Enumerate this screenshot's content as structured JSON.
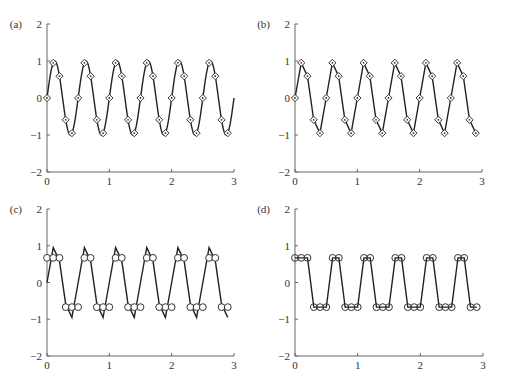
{
  "figure": {
    "layout": "2x2 grid",
    "colors": {
      "line": "#222222",
      "axis": "#666666",
      "marker_fill": "#ffffff",
      "background": "#ffffff"
    }
  },
  "chart_data": [
    {
      "panel": "(a)",
      "type": "line",
      "description": "Continuous sinusoid (2 Hz) with samples taken every 0.1 s shown as diamonds",
      "xlim": [
        0,
        3
      ],
      "ylim": [
        -2,
        2
      ],
      "xticks": [
        "0",
        "1",
        "2",
        "3"
      ],
      "yticks": [
        "-2",
        "-1",
        "0",
        "1",
        "2"
      ],
      "grid": false,
      "series": [
        {
          "name": "continuous signal",
          "style": "smooth line",
          "function": "sin(2*pi*2*t)",
          "t_range": [
            0,
            3
          ]
        },
        {
          "name": "samples",
          "style": "diamond markers",
          "x": [
            0,
            0.1,
            0.2,
            0.3,
            0.4,
            0.5,
            0.6,
            0.7,
            0.8,
            0.9,
            1.0,
            1.1,
            1.2,
            1.3,
            1.4,
            1.5,
            1.6,
            1.7,
            1.8,
            1.9,
            2.0,
            2.1,
            2.2,
            2.3,
            2.4,
            2.5,
            2.6,
            2.7,
            2.8,
            2.9
          ],
          "values": [
            0,
            0.95,
            0.59,
            -0.59,
            -0.95,
            0,
            0.95,
            0.59,
            -0.59,
            -0.95,
            0,
            0.95,
            0.59,
            -0.59,
            -0.95,
            0,
            0.95,
            0.59,
            -0.59,
            -0.95,
            0,
            0.95,
            0.59,
            -0.59,
            -0.95,
            0,
            0.95,
            0.59,
            -0.59,
            -0.95
          ]
        }
      ]
    },
    {
      "panel": "(b)",
      "type": "line",
      "description": "Samples (diamonds) connected by straight line segments",
      "xlim": [
        0,
        3
      ],
      "ylim": [
        -2,
        2
      ],
      "xticks": [
        "0",
        "1",
        "2",
        "3"
      ],
      "yticks": [
        "-2",
        "-1",
        "0",
        "1",
        "2"
      ],
      "grid": false,
      "series": [
        {
          "name": "sampled signal",
          "style": "line with diamond markers",
          "x": [
            0,
            0.1,
            0.2,
            0.3,
            0.4,
            0.5,
            0.6,
            0.7,
            0.8,
            0.9,
            1.0,
            1.1,
            1.2,
            1.3,
            1.4,
            1.5,
            1.6,
            1.7,
            1.8,
            1.9,
            2.0,
            2.1,
            2.2,
            2.3,
            2.4,
            2.5,
            2.6,
            2.7,
            2.8,
            2.9
          ],
          "values": [
            0,
            0.95,
            0.59,
            -0.59,
            -0.95,
            0,
            0.95,
            0.59,
            -0.59,
            -0.95,
            0,
            0.95,
            0.59,
            -0.59,
            -0.95,
            0,
            0.95,
            0.59,
            -0.59,
            -0.95,
            0,
            0.95,
            0.59,
            -0.59,
            -0.95,
            0,
            0.95,
            0.59,
            -0.59,
            -0.95
          ]
        }
      ]
    },
    {
      "panel": "(c)",
      "type": "line",
      "description": "Sampled signal (line) with quantized sample values (circles at +/-0.67)",
      "xlim": [
        0,
        3
      ],
      "ylim": [
        -2,
        2
      ],
      "xticks": [
        "0",
        "1",
        "2",
        "3"
      ],
      "yticks": [
        "-2",
        "-1",
        "0",
        "1",
        "2"
      ],
      "grid": false,
      "series": [
        {
          "name": "sampled signal",
          "style": "line",
          "x": [
            0,
            0.1,
            0.2,
            0.3,
            0.4,
            0.5,
            0.6,
            0.7,
            0.8,
            0.9,
            1.0,
            1.1,
            1.2,
            1.3,
            1.4,
            1.5,
            1.6,
            1.7,
            1.8,
            1.9,
            2.0,
            2.1,
            2.2,
            2.3,
            2.4,
            2.5,
            2.6,
            2.7,
            2.8,
            2.9
          ],
          "values": [
            0,
            0.95,
            0.59,
            -0.59,
            -0.95,
            0,
            0.95,
            0.59,
            -0.59,
            -0.95,
            0,
            0.95,
            0.59,
            -0.59,
            -0.95,
            0,
            0.95,
            0.59,
            -0.59,
            -0.95,
            0,
            0.95,
            0.59,
            -0.59,
            -0.95,
            0,
            0.95,
            0.59,
            -0.59,
            -0.95
          ]
        },
        {
          "name": "quantized samples",
          "style": "circle markers",
          "x": [
            0,
            0.1,
            0.2,
            0.3,
            0.4,
            0.5,
            0.6,
            0.7,
            0.8,
            0.9,
            1.0,
            1.1,
            1.2,
            1.3,
            1.4,
            1.5,
            1.6,
            1.7,
            1.8,
            1.9,
            2.0,
            2.1,
            2.2,
            2.3,
            2.4,
            2.5,
            2.6,
            2.7,
            2.8,
            2.9
          ],
          "values": [
            0.67,
            0.67,
            0.67,
            -0.67,
            -0.67,
            -0.67,
            0.67,
            0.67,
            -0.67,
            -0.67,
            -0.67,
            0.67,
            0.67,
            -0.67,
            -0.67,
            -0.67,
            0.67,
            0.67,
            -0.67,
            -0.67,
            -0.67,
            0.67,
            0.67,
            -0.67,
            -0.67,
            -0.67,
            0.67,
            0.67,
            -0.67,
            -0.67
          ]
        }
      ]
    },
    {
      "panel": "(d)",
      "type": "line",
      "description": "Quantized samples (circles) connected by straight line segments",
      "xlim": [
        0,
        3
      ],
      "ylim": [
        -2,
        2
      ],
      "xticks": [
        "0",
        "1",
        "2",
        "3"
      ],
      "yticks": [
        "-2",
        "-1",
        "0",
        "1",
        "2"
      ],
      "grid": false,
      "series": [
        {
          "name": "quantized signal",
          "style": "line with circle markers",
          "x": [
            0,
            0.1,
            0.2,
            0.3,
            0.4,
            0.5,
            0.6,
            0.7,
            0.8,
            0.9,
            1.0,
            1.1,
            1.2,
            1.3,
            1.4,
            1.5,
            1.6,
            1.7,
            1.8,
            1.9,
            2.0,
            2.1,
            2.2,
            2.3,
            2.4,
            2.5,
            2.6,
            2.7,
            2.8,
            2.9
          ],
          "values": [
            0.67,
            0.67,
            0.67,
            -0.67,
            -0.67,
            -0.67,
            0.67,
            0.67,
            -0.67,
            -0.67,
            -0.67,
            0.67,
            0.67,
            -0.67,
            -0.67,
            -0.67,
            0.67,
            0.67,
            -0.67,
            -0.67,
            -0.67,
            0.67,
            0.67,
            -0.67,
            -0.67,
            -0.67,
            0.67,
            0.67,
            -0.67,
            -0.67
          ]
        }
      ]
    }
  ]
}
